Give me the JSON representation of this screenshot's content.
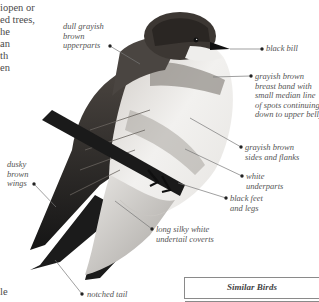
{
  "body_text": {
    "lines": [
      "iopen or",
      "ed trees,",
      "he",
      "an",
      "th",
      "en"
    ],
    "bottom_fragment": "le"
  },
  "labels": {
    "upperparts": "dull grayish\nbrown\nupperparts",
    "bill": "black bill",
    "breast_band": "grayish brown\nbreast band with\nsmall median line\nof spots continuing\ndown to upper belly",
    "sides": "grayish brown\nsides and flanks",
    "underparts": "white\nunderparts",
    "feet": "black feet\nand legs",
    "wings": "dusky\nbrown\nwings",
    "undertail": "long silky white\nundertail coverts",
    "tail": "notched tail"
  },
  "similar_birds": {
    "title": "Similar Birds"
  },
  "colors": {
    "bird_dark": "#1e1e1e",
    "bird_mid": "#6b6560",
    "bird_light": "#d8d6d3",
    "label_text": "#555555",
    "leader_line": "#777777"
  }
}
